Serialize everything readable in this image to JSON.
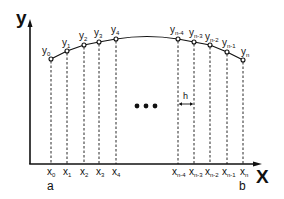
{
  "diagram": {
    "type": "trapezoidal-rule-partition",
    "axes": {
      "x_title": "X",
      "y_title": "y"
    },
    "endpoints": {
      "a": "a",
      "b": "b"
    },
    "step_label": "h",
    "ellipsis": "•••",
    "points_left": [
      {
        "y_base": "y",
        "y_sub": "0",
        "x_base": "x",
        "x_sub": "0"
      },
      {
        "y_base": "y",
        "y_sub": "1",
        "x_base": "x",
        "x_sub": "1"
      },
      {
        "y_base": "y",
        "y_sub": "2",
        "x_base": "x",
        "x_sub": "2"
      },
      {
        "y_base": "y",
        "y_sub": "3",
        "x_base": "x",
        "x_sub": "3"
      },
      {
        "y_base": "y",
        "y_sub": "4",
        "x_base": "x",
        "x_sub": "4"
      }
    ],
    "points_right": [
      {
        "y_base": "y",
        "y_sub": "n-4",
        "x_base": "x",
        "x_sub": "n-4"
      },
      {
        "y_base": "y",
        "y_sub": "n-3",
        "x_base": "x",
        "x_sub": "n-3"
      },
      {
        "y_base": "y",
        "y_sub": "n-2",
        "x_base": "x",
        "x_sub": "n-2"
      },
      {
        "y_base": "y",
        "y_sub": "n-1",
        "x_base": "x",
        "x_sub": "n-1"
      },
      {
        "y_base": "y",
        "y_sub": "n",
        "x_base": "x",
        "x_sub": "n"
      }
    ],
    "colors": {
      "ink": "#111111",
      "background": "#ffffff"
    }
  }
}
